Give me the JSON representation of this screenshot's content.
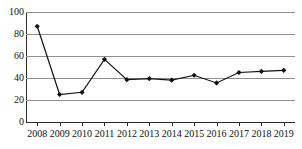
{
  "chart_data": {
    "type": "line",
    "title": "",
    "xlabel": "",
    "ylabel": "",
    "categories": [
      "2008",
      "2009",
      "2010",
      "2011",
      "2012",
      "2013",
      "2014",
      "2015",
      "2016",
      "2017",
      "2018",
      "2019"
    ],
    "values": [
      87,
      25,
      27,
      57,
      38.5,
      39.5,
      38,
      42.5,
      35.5,
      45,
      46,
      47
    ],
    "series": [
      {
        "name": "series-1",
        "values": [
          87,
          25,
          27,
          57,
          38.5,
          39.5,
          38,
          42.5,
          35.5,
          45,
          46,
          47
        ]
      }
    ],
    "ylim": [
      0,
      100
    ],
    "yticks": [
      0,
      20,
      40,
      60,
      80,
      100
    ],
    "ytick_labels": [
      "0",
      "20",
      "40",
      "60",
      "80",
      "100"
    ],
    "grid": "horizontal",
    "legend": "none",
    "marker": "diamond",
    "line_color": "#111111",
    "grid_color": "#8f8f8f",
    "axis_color": "#2b2b2b"
  },
  "title_remnant": {
    "text": ""
  }
}
